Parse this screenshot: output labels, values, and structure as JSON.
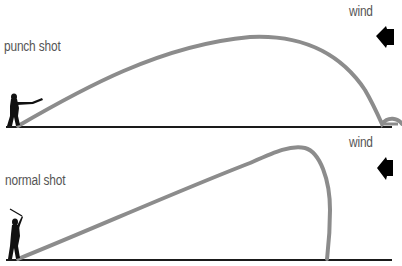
{
  "panels": [
    {
      "title": "punch shot",
      "wind_label": "wind",
      "description": "low trajectory into wind, ball lands and rolls forward"
    },
    {
      "title": "normal shot",
      "wind_label": "wind",
      "description": "higher trajectory into wind, ball balloons and drops almost vertically"
    }
  ],
  "icons": {
    "wind_arrow": "left-pointing-arrow",
    "golfer": "golfer-silhouette"
  },
  "colors": {
    "trajectory": "#8c8c8c",
    "ground": "#1a1a1a",
    "text": "#555555",
    "arrow": "#000000"
  }
}
